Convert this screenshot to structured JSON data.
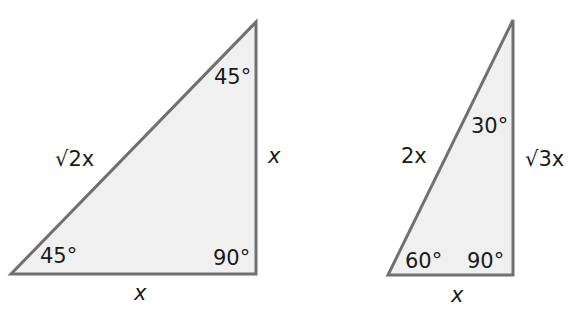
{
  "figure": {
    "triangle_45": {
      "hypotenuse": "√2x",
      "vertical_leg": "x",
      "horizontal_leg": "x",
      "angle_top": "45°",
      "angle_bottom_left": "45°",
      "angle_right": "90°"
    },
    "triangle_30_60": {
      "hypotenuse": "2x",
      "vertical_leg": "√3x",
      "horizontal_leg": "x",
      "angle_top": "30°",
      "angle_bottom_left": "60°",
      "angle_right": "90°"
    },
    "colors": {
      "fill": "#f0f0f0",
      "stroke": "#707070",
      "text": "#1a1a1a"
    }
  }
}
